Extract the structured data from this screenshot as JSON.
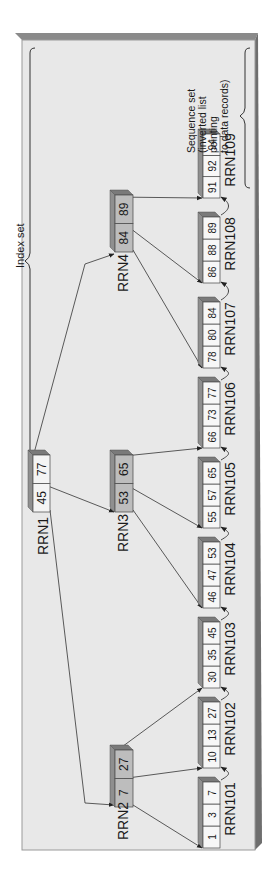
{
  "diagram": {
    "type": "b-plus-tree",
    "orientation": "rotated-90-ccw",
    "colors": {
      "background": "#ffffff",
      "panel": "#e8e8e8",
      "panel_edge": "#8a8a8a",
      "panel_shadow": "#6e6e6e",
      "root_cell": "#f4f4f4",
      "index_cell": "#bdbdbd",
      "leaf_cell": "#f7f7f7",
      "box_top": "#8f8f8f",
      "box_side": "#7a7a7a",
      "line": "#333333"
    },
    "labels": {
      "index_set": "Index set",
      "sequence_set_lines": [
        "Sequence set",
        "(inverted list",
        "pointing",
        "to data records)"
      ]
    },
    "index_nodes": [
      {
        "id": "RRN1",
        "label": "RRN1",
        "level": "root",
        "keys": [
          "45",
          "77"
        ]
      },
      {
        "id": "RRN2",
        "label": "RRN2",
        "level": "index",
        "keys": [
          "7",
          "27"
        ]
      },
      {
        "id": "RRN3",
        "label": "RRN3",
        "level": "index",
        "keys": [
          "53",
          "65"
        ]
      },
      {
        "id": "RRN4",
        "label": "RRN4",
        "level": "index",
        "keys": [
          "84",
          "89"
        ]
      }
    ],
    "leaf_nodes": [
      {
        "id": "RRN101",
        "label": "RRN101",
        "keys": [
          "1",
          "3",
          "7"
        ]
      },
      {
        "id": "RRN102",
        "label": "RRN102",
        "keys": [
          "10",
          "13",
          "27"
        ]
      },
      {
        "id": "RRN103",
        "label": "RRN103",
        "keys": [
          "30",
          "35",
          "45"
        ]
      },
      {
        "id": "RRN104",
        "label": "RRN104",
        "keys": [
          "46",
          "47",
          "53"
        ]
      },
      {
        "id": "RRN105",
        "label": "RRN105",
        "keys": [
          "55",
          "57",
          "65"
        ]
      },
      {
        "id": "RRN106",
        "label": "RRN106",
        "keys": [
          "66",
          "73",
          "77"
        ]
      },
      {
        "id": "RRN107",
        "label": "RRN107",
        "keys": [
          "78",
          "80",
          "84"
        ]
      },
      {
        "id": "RRN108",
        "label": "RRN108",
        "keys": [
          "86",
          "88",
          "89"
        ]
      },
      {
        "id": "RRN109",
        "label": "RRN109",
        "keys": [
          "91",
          "92",
          "94"
        ]
      }
    ],
    "edges": [
      {
        "from": "RRN1",
        "to": "RRN2"
      },
      {
        "from": "RRN1",
        "to": "RRN3"
      },
      {
        "from": "RRN1",
        "to": "RRN4"
      },
      {
        "from": "RRN2",
        "to": "RRN101"
      },
      {
        "from": "RRN2",
        "to": "RRN102"
      },
      {
        "from": "RRN2",
        "to": "RRN103"
      },
      {
        "from": "RRN3",
        "to": "RRN104"
      },
      {
        "from": "RRN3",
        "to": "RRN105"
      },
      {
        "from": "RRN3",
        "to": "RRN106"
      },
      {
        "from": "RRN4",
        "to": "RRN107"
      },
      {
        "from": "RRN4",
        "to": "RRN108"
      },
      {
        "from": "RRN4",
        "to": "RRN109"
      },
      {
        "from": "RRN101",
        "to": "RRN102",
        "kind": "sibling"
      },
      {
        "from": "RRN102",
        "to": "RRN103",
        "kind": "sibling"
      },
      {
        "from": "RRN103",
        "to": "RRN104",
        "kind": "sibling"
      },
      {
        "from": "RRN104",
        "to": "RRN105",
        "kind": "sibling"
      },
      {
        "from": "RRN105",
        "to": "RRN106",
        "kind": "sibling"
      },
      {
        "from": "RRN106",
        "to": "RRN107",
        "kind": "sibling"
      },
      {
        "from": "RRN107",
        "to": "RRN108",
        "kind": "sibling"
      },
      {
        "from": "RRN108",
        "to": "RRN109",
        "kind": "sibling"
      }
    ]
  }
}
